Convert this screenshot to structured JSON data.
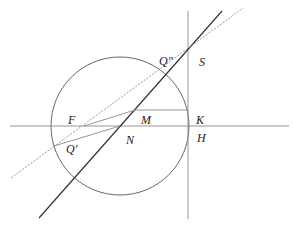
{
  "diagram": {
    "type": "geometric-construction",
    "colors": {
      "stroke_dark": "#333333",
      "stroke_light": "#8a8a8a",
      "background": "#ffffff"
    },
    "circle": {
      "cx": 120,
      "cy": 126,
      "r": 69
    },
    "lines": {
      "horizontal_axis": {
        "x1": 10,
        "y1": 126,
        "x2": 289,
        "y2": 126
      },
      "vertical_line": {
        "x1": 188,
        "y1": 11,
        "x2": 188,
        "y2": 219
      },
      "solid_diagonal": {
        "x1": 39,
        "y1": 218,
        "x2": 222,
        "y2": 11
      },
      "dashed_diagonal": {
        "x1": 11,
        "y1": 178,
        "x2": 243,
        "y2": 8
      },
      "segment_MK": {
        "x1": 135,
        "y1": 110,
        "x2": 188,
        "y2": 110
      },
      "segment_FM": {
        "x1": 84,
        "y1": 126,
        "x2": 135,
        "y2": 110
      },
      "segment_QprimeN": {
        "x1": 54,
        "y1": 146,
        "x2": 120,
        "y2": 126
      }
    },
    "labels": [
      {
        "text": "Q\"",
        "x": 159,
        "y": 65
      },
      {
        "text": "S",
        "x": 199,
        "y": 66
      },
      {
        "text": "F",
        "x": 68,
        "y": 124
      },
      {
        "text": "M",
        "x": 141,
        "y": 124
      },
      {
        "text": "K",
        "x": 196,
        "y": 124
      },
      {
        "text": "N",
        "x": 126,
        "y": 144
      },
      {
        "text": "H",
        "x": 197,
        "y": 142
      },
      {
        "text": "Q'",
        "x": 66,
        "y": 153
      }
    ]
  }
}
